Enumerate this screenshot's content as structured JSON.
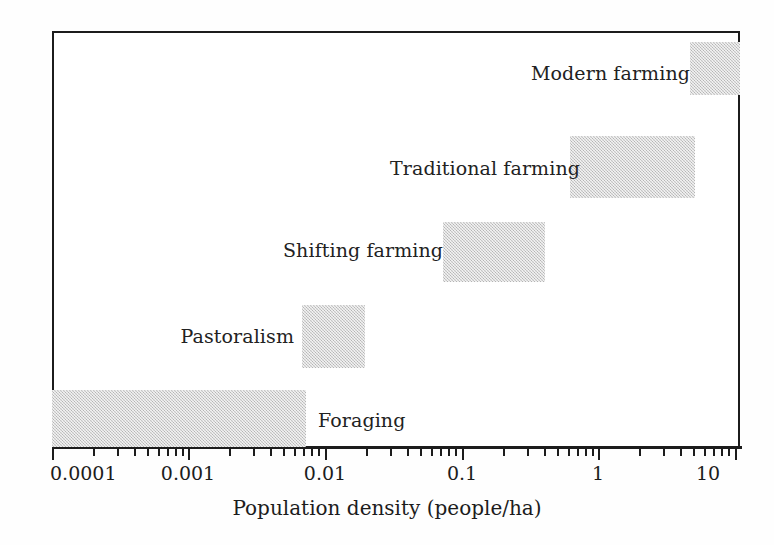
{
  "chart_data": {
    "type": "bar",
    "orientation": "horizontal",
    "title": "",
    "subtitle": "",
    "xlabel": "Population density (people/ha)",
    "ylabel": "",
    "xscale": "log",
    "xlim": [
      0.0001,
      0.022
    ],
    "grid": false,
    "legend": null,
    "annotations": [],
    "tick_labels": [
      "0.0001",
      "0.001",
      "0.01",
      "0.1",
      "1",
      "10"
    ],
    "tick_values": [
      0.0001,
      0.001,
      0.01,
      0.1,
      1,
      10
    ],
    "categories": [
      "Modern farming",
      "Traditional farming",
      "Shifting farming",
      "Pastoralism",
      "Foraging"
    ],
    "ranges": [
      {
        "label": "Modern farming",
        "low": 7.5,
        "high": 20.0
      },
      {
        "label": "Traditional farming",
        "low": 0.95,
        "high": 8.0
      },
      {
        "label": "Shifting farming",
        "low": 0.095,
        "high": 0.5
      },
      {
        "label": "Pastoralism",
        "low": 0.0082,
        "high": 0.023
      },
      {
        "label": "Foraging",
        "low": 0.0001,
        "high": 0.0088
      }
    ],
    "bar_color": "#c9c9c9",
    "axis_color": "#1c1c1c"
  },
  "bars": [
    {
      "name": "modern-farming",
      "label": "Modern farming",
      "left": 690,
      "top": 42,
      "width": 50,
      "height": 53,
      "label_left": 531,
      "label_top": 62,
      "label_width": 150
    },
    {
      "name": "traditional-farming",
      "label": "Traditional farming",
      "left": 570,
      "top": 136,
      "width": 125,
      "height": 62,
      "label_left": 390,
      "label_top": 157,
      "label_width": 172
    },
    {
      "name": "shifting-farming",
      "label": "Shifting farming",
      "left": 443,
      "top": 222,
      "width": 102,
      "height": 60,
      "label_left": 283,
      "label_top": 239,
      "label_width": 152
    },
    {
      "name": "pastoralism",
      "label": "Pastoralism",
      "left": 302,
      "top": 305,
      "width": 63,
      "height": 63,
      "label_left": 176,
      "label_top": 325,
      "label_width": 118
    },
    {
      "name": "foraging",
      "label": "Foraging",
      "left": 52,
      "top": 390,
      "width": 254,
      "height": 57,
      "label_left": 318,
      "label_top": 409,
      "label_width": 90
    }
  ],
  "axis": {
    "title": "Population density (people/ha)",
    "ticks": [
      {
        "x": 52,
        "type": "major",
        "label": "0.0001",
        "label_x": 54
      },
      {
        "x": 93,
        "type": "minor"
      },
      {
        "x": 117,
        "type": "minor"
      },
      {
        "x": 134,
        "type": "minor"
      },
      {
        "x": 147,
        "type": "minor"
      },
      {
        "x": 158,
        "type": "minor"
      },
      {
        "x": 167,
        "type": "minor"
      },
      {
        "x": 175,
        "type": "minor"
      },
      {
        "x": 182,
        "type": "minor"
      },
      {
        "x": 188,
        "type": "major",
        "label": "0.001",
        "label_x": 188
      },
      {
        "x": 229,
        "type": "minor"
      },
      {
        "x": 253,
        "type": "minor"
      },
      {
        "x": 270,
        "type": "minor"
      },
      {
        "x": 283,
        "type": "minor"
      },
      {
        "x": 294,
        "type": "minor"
      },
      {
        "x": 303,
        "type": "minor"
      },
      {
        "x": 311,
        "type": "minor"
      },
      {
        "x": 318,
        "type": "minor"
      },
      {
        "x": 325,
        "type": "major",
        "label": "0.01",
        "label_x": 325
      },
      {
        "x": 366,
        "type": "minor"
      },
      {
        "x": 390,
        "type": "minor"
      },
      {
        "x": 407,
        "type": "minor"
      },
      {
        "x": 420,
        "type": "minor"
      },
      {
        "x": 431,
        "type": "minor"
      },
      {
        "x": 440,
        "type": "minor"
      },
      {
        "x": 448,
        "type": "minor"
      },
      {
        "x": 455,
        "type": "minor"
      },
      {
        "x": 462,
        "type": "major",
        "label": "0.1",
        "label_x": 462
      },
      {
        "x": 503,
        "type": "minor"
      },
      {
        "x": 527,
        "type": "minor"
      },
      {
        "x": 544,
        "type": "minor"
      },
      {
        "x": 557,
        "type": "minor"
      },
      {
        "x": 568,
        "type": "minor"
      },
      {
        "x": 577,
        "type": "minor"
      },
      {
        "x": 585,
        "type": "minor"
      },
      {
        "x": 592,
        "type": "minor"
      },
      {
        "x": 598,
        "type": "major",
        "label": "1",
        "label_x": 598
      },
      {
        "x": 639,
        "type": "minor"
      },
      {
        "x": 663,
        "type": "minor"
      },
      {
        "x": 680,
        "type": "minor"
      },
      {
        "x": 693,
        "type": "minor"
      },
      {
        "x": 704,
        "type": "minor"
      },
      {
        "x": 713,
        "type": "minor"
      },
      {
        "x": 721,
        "type": "minor"
      },
      {
        "x": 728,
        "type": "minor"
      },
      {
        "x": 735,
        "type": "major",
        "label": "10",
        "label_x": 708
      }
    ]
  }
}
